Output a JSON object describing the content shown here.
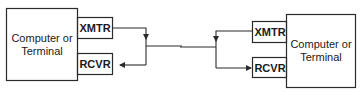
{
  "diagram": {
    "type": "block-diagram",
    "colors": {
      "stroke": "#2a2a2a",
      "background": "#ffffff",
      "text": "#1a1a1a"
    },
    "left_station": {
      "main_box": {
        "line1": "Computer or",
        "line2": "Terminal"
      },
      "transmitter": {
        "label": "XMTR"
      },
      "receiver": {
        "label": "RCVR"
      }
    },
    "right_station": {
      "main_box": {
        "line1": "Computer or",
        "line2": "Terminal"
      },
      "transmitter": {
        "label": "XMTR"
      },
      "receiver": {
        "label": "RCVR"
      }
    },
    "link": {
      "description": "shared line connecting both stations"
    }
  }
}
